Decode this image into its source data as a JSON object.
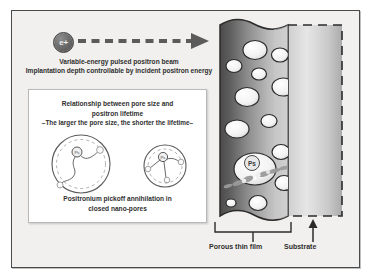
{
  "figure": {
    "background_color": "#f1f0ee",
    "border_color": "#4a4a4a"
  },
  "beam": {
    "source_label": "e+",
    "source_icon": "positron-particle-icon",
    "arrow_icon": "dashed-arrow-right-icon",
    "caption_line1": "Variable-energy pulsed positron beam",
    "caption_line2": "Implantation depth controllable by incident positron energy"
  },
  "panel": {
    "title_line1": "Relationship between pore size and",
    "title_line2": "positron lifetime",
    "subtitle": "–The larger the pore size, the shorter the lifetime–",
    "caption_line1": "Positronium pickoff annihilation in",
    "caption_line2": "closed nano-pores",
    "pores": [
      {
        "name": "large-pore",
        "ps_label": "Ps",
        "description": "large pore with long positronium trajectory"
      },
      {
        "name": "small-pore",
        "ps_label": "Ps",
        "description": "small pore with short positronium trajectories"
      }
    ]
  },
  "sample": {
    "film_label": "Porous thin film",
    "substrate_label": "Substrate",
    "film_colors": {
      "dark": "#4f4f4f",
      "mid": "#8f8f8f",
      "light": "#d8d8d8"
    },
    "substrate_colors": {
      "light": "#e4e4e4",
      "mid": "#b4b4b4"
    },
    "pore_fill": "#f4f4f4",
    "annihilation_label": "Ps",
    "pore_count": 15
  }
}
